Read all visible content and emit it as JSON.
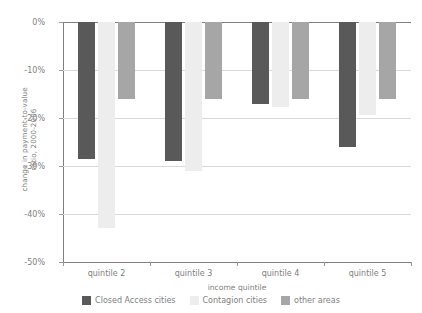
{
  "chart_data": {
    "type": "bar",
    "title": "",
    "subtitle": "",
    "xlabel": "income quintile",
    "ylabel": "change in payment-to-value\nratio, 2000-2006",
    "categories": [
      "quintile 2",
      "quintile 3",
      "quintile 4",
      "quintile 5"
    ],
    "series": [
      {
        "name": "Closed Access cities",
        "color": "#595959",
        "values": [
          -28.5,
          -29.0,
          -17.0,
          -26.0
        ]
      },
      {
        "name": "Contagion cities",
        "color": "#ededed",
        "values": [
          -43.0,
          -31.0,
          -17.7,
          -19.4
        ]
      },
      {
        "name": "other areas",
        "color": "#a6a6a6",
        "values": [
          -16.0,
          -16.0,
          -16.0,
          -16.0
        ]
      }
    ],
    "ylim": [
      -50,
      0
    ],
    "ytick_values": [
      0,
      -10,
      -20,
      -30,
      -40,
      -50
    ],
    "ytick_labels": [
      "0%",
      "-10%",
      "-20%",
      "-30%",
      "-40%",
      "-50%"
    ],
    "grid": true,
    "legend_position": "bottom"
  }
}
